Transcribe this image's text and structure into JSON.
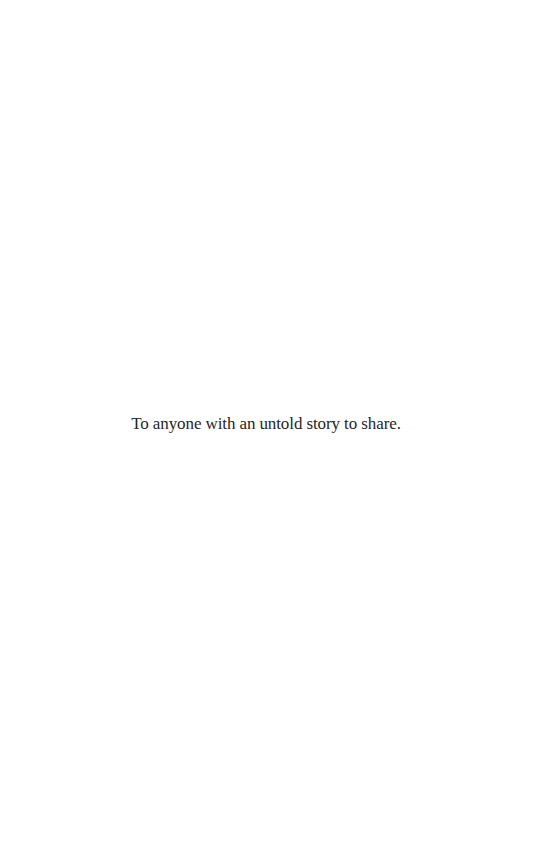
{
  "page": {
    "type": "dedication",
    "background_color": "#ffffff",
    "text_color": "#262626"
  },
  "dedication": {
    "text": "To anyone with an untold story to share."
  }
}
